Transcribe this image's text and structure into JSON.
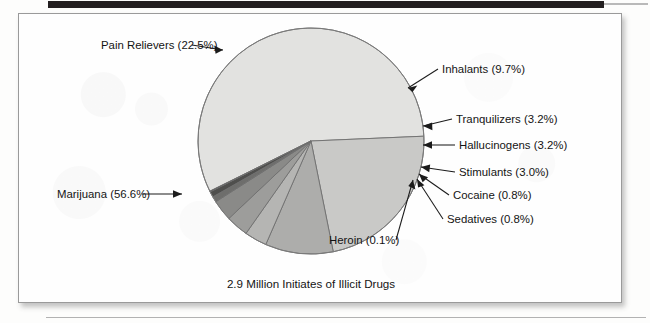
{
  "figure": {
    "caption": "2.9 Million Initiates of Illicit Drugs",
    "border_color": "#9a9a9a",
    "background_color": "#fefefe"
  },
  "chart_data": {
    "type": "pie",
    "title": "2.9 Million Initiates of Illicit Drugs",
    "total_label": "2.9 Million Initiates of Illicit Drugs",
    "units": "percent of initiates",
    "legend": "none (direct labels with leader lines)",
    "grid": false,
    "categories": [
      "Marijuana",
      "Pain Relievers",
      "Inhalants",
      "Tranquilizers",
      "Hallucinogens",
      "Stimulants",
      "Cocaine",
      "Sedatives",
      "Heroin"
    ],
    "values": [
      56.6,
      22.5,
      9.7,
      3.2,
      3.2,
      3.0,
      0.8,
      0.8,
      0.1
    ],
    "slices": [
      {
        "name": "Marijuana",
        "value": 56.6,
        "label": "Marijuana (56.6%)",
        "color": "#e2e2e0"
      },
      {
        "name": "Pain Relievers",
        "value": 22.5,
        "label": "Pain Relievers (22.5%)",
        "color": "#c9c9c7"
      },
      {
        "name": "Inhalants",
        "value": 9.7,
        "label": "Inhalants (9.7%)",
        "color": "#adadab"
      },
      {
        "name": "Tranquilizers",
        "value": 3.2,
        "label": "Tranquilizers (3.2%)",
        "color": "#b5b5b3"
      },
      {
        "name": "Hallucinogens",
        "value": 3.2,
        "label": "Hallucinogens (3.2%)",
        "color": "#9d9d9b"
      },
      {
        "name": "Stimulants",
        "value": 3.0,
        "label": "Stimulants (3.0%)",
        "color": "#8a8a88"
      },
      {
        "name": "Cocaine",
        "value": 0.8,
        "label": "Cocaine (0.8%)",
        "color": "#6e6e6c"
      },
      {
        "name": "Sedatives",
        "value": 0.8,
        "label": "Sedatives (0.8%)",
        "color": "#4f4f4d"
      },
      {
        "name": "Heroin",
        "value": 0.1,
        "label": "Heroin (0.1%)",
        "color": "#2b2b2a"
      }
    ]
  }
}
